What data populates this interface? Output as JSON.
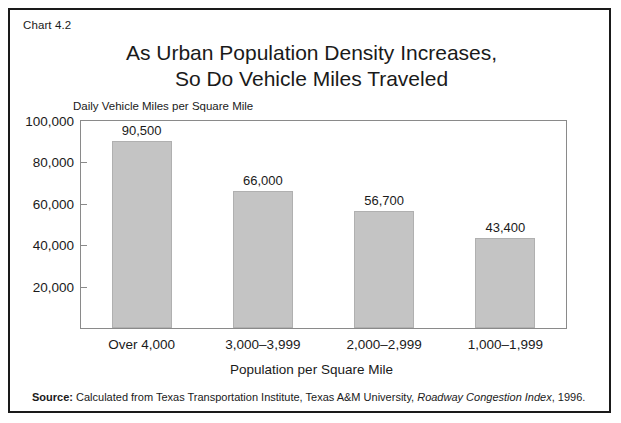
{
  "figure": {
    "chart_number": "Chart 4.2",
    "title_line1": "As Urban Population Density Increases,",
    "title_line2": "So Do Vehicle Miles Traveled",
    "y_axis_caption": "Daily Vehicle Miles per Square Mile",
    "x_axis_title": "Population per Square Mile",
    "source": {
      "label": "Source:",
      "text_before_italic": " Calculated from Texas Transportation Institute, Texas A&M University, ",
      "italic_title": "Roadway Congestion Index",
      "text_after_italic": ", 1996."
    },
    "colors": {
      "bar_fill": "#c4c4c4",
      "bar_border": "#b0b0b0",
      "frame": "#8a8a8a",
      "outer_border": "#1a1a1a",
      "text": "#1a1a1a",
      "background": "#ffffff"
    }
  },
  "chart_data": {
    "type": "bar",
    "title": "As Urban Population Density Increases, So Do Vehicle Miles Traveled",
    "subtitle": "Chart 4.2",
    "xlabel": "Population per Square Mile",
    "ylabel": "Daily Vehicle Miles per Square Mile",
    "categories": [
      "Over 4,000",
      "3,000–3,999",
      "2,000–2,999",
      "1,000–1,999"
    ],
    "values": [
      90500,
      66000,
      56700,
      43400
    ],
    "value_labels": [
      "90,500",
      "66,000",
      "56,700",
      "43,400"
    ],
    "ylim": [
      0,
      100000
    ],
    "yticks": [
      20000,
      40000,
      60000,
      80000,
      100000
    ],
    "ytick_labels": [
      "20,000",
      "40,000",
      "60,000",
      "80,000",
      "100,000"
    ],
    "grid": false,
    "legend": null,
    "annotations": [
      "Source: Calculated from Texas Transportation Institute, Texas A&M University, Roadway Congestion Index, 1996."
    ]
  }
}
